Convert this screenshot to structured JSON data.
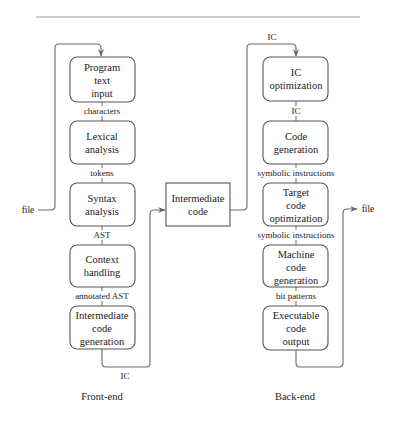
{
  "diagram": {
    "type": "compiler-pipeline",
    "front_end": {
      "title": "Front-end",
      "input_label": "file",
      "boxes": [
        {
          "id": "program-text-input",
          "lines": [
            "Program",
            "text",
            "input"
          ]
        },
        {
          "id": "lexical-analysis",
          "lines": [
            "Lexical",
            "analysis"
          ]
        },
        {
          "id": "syntax-analysis",
          "lines": [
            "Syntax",
            "analysis"
          ]
        },
        {
          "id": "context-handling",
          "lines": [
            "Context",
            "handling"
          ]
        },
        {
          "id": "intermediate-code-generation",
          "lines": [
            "Intermediate",
            "code",
            "generation"
          ]
        }
      ],
      "edges": [
        "characters",
        "tokens",
        "AST",
        "annotated AST"
      ],
      "output_label": "IC"
    },
    "middle": {
      "box": {
        "id": "intermediate-code",
        "lines": [
          "Intermediate",
          "code"
        ]
      }
    },
    "back_end": {
      "title": "Back-end",
      "input_label": "IC",
      "boxes": [
        {
          "id": "ic-optimization",
          "lines": [
            "IC",
            "optimization"
          ]
        },
        {
          "id": "code-generation",
          "lines": [
            "Code",
            "generation"
          ]
        },
        {
          "id": "target-code-optimization",
          "lines": [
            "Target",
            "code",
            "optimization"
          ]
        },
        {
          "id": "machine-code-generation",
          "lines": [
            "Machine",
            "code",
            "generation"
          ]
        },
        {
          "id": "executable-code-output",
          "lines": [
            "Executable",
            "code",
            "output"
          ]
        }
      ],
      "edges": [
        "IC",
        "symbolic instructions",
        "symbolic instructions",
        "bit patterns"
      ],
      "output_label": "file"
    }
  },
  "colors": {
    "box_stroke": "#555555",
    "line": "#6a6a6a",
    "text": "#222222",
    "rule": "#9a9a9a",
    "background": "#ffffff"
  }
}
